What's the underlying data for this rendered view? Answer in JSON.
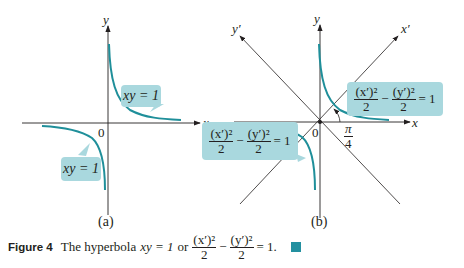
{
  "colors": {
    "curve": "#1f8f9a",
    "bubble": "#a9d8de",
    "axis": "#231f20",
    "endmark": "#2390a0"
  },
  "panel_a": {
    "label": "(a)",
    "x_axis_label": "x",
    "y_axis_label": "y",
    "origin_label": "0",
    "bubble_upper": "xy = 1",
    "bubble_lower": "xy = 1"
  },
  "panel_b": {
    "label": "(b)",
    "x_axis_label": "x",
    "y_axis_label": "y",
    "x_prime_label": "x′",
    "y_prime_label": "y′",
    "origin_label": "0",
    "angle_num": "π",
    "angle_den": "4",
    "bubble_upper": {
      "term1_num": "(x′)²",
      "term1_den": "2",
      "minus": "−",
      "term2_num": "(y′)²",
      "term2_den": "2",
      "rhs": "= 1"
    },
    "bubble_lower": {
      "term1_num": "(x′)²",
      "term1_den": "2",
      "minus": "−",
      "term2_num": "(y′)²",
      "term2_den": "2",
      "rhs": "= 1"
    }
  },
  "caption": {
    "figure_label": "Figure 4",
    "text": "The hyperbola",
    "eq1": "xy = 1",
    "or": "or",
    "term1_num": "(x′)²",
    "term1_den": "2",
    "minus": "−",
    "term2_num": "(y′)²",
    "term2_den": "2",
    "rhs": "= 1."
  }
}
